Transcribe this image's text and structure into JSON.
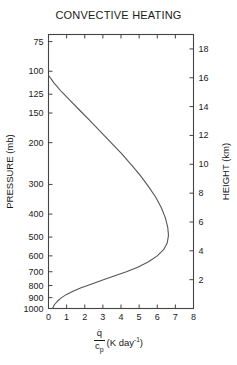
{
  "chart_data": {
    "type": "line",
    "title": "CONVECTIVE HEATING",
    "xlabel": "q̇ / c_p (K day⁻¹)",
    "ylabel": "PRESSURE (mb)",
    "y2label": "HEIGHT (km)",
    "xlim": [
      0,
      8
    ],
    "ylim": [
      70,
      1000
    ],
    "yscale": "log-pressure (inverted)",
    "y2lim": [
      0,
      19
    ],
    "grid": false,
    "legend": null,
    "xticks": [
      0,
      1,
      2,
      3,
      4,
      5,
      6,
      7,
      8
    ],
    "xticklabels": [
      "0",
      "1",
      "2",
      "3",
      "4",
      "5",
      "6",
      "7",
      "8"
    ],
    "yticks": [
      75,
      100,
      125,
      150,
      200,
      300,
      400,
      500,
      600,
      700,
      800,
      900,
      1000
    ],
    "yticklabels": [
      "75",
      "100",
      "125",
      "150",
      "200",
      "300",
      "400",
      "500",
      "600",
      "700",
      "800",
      "900",
      "1000"
    ],
    "y2ticks": [
      2,
      4,
      6,
      8,
      10,
      12,
      14,
      16,
      18
    ],
    "y2ticklabels": [
      "2",
      "4",
      "6",
      "8",
      "10",
      "12",
      "14",
      "16",
      "18"
    ],
    "series": [
      {
        "name": "convective heating rate",
        "x": [
          0.04,
          0.3,
          0.72,
          1.2,
          1.72,
          2.3,
          2.88,
          3.45,
          4.02,
          4.55,
          5.05,
          5.5,
          5.9,
          6.22,
          6.45,
          6.58,
          6.62,
          6.55,
          6.35,
          6.0,
          5.52,
          4.95,
          4.3,
          3.62,
          2.95,
          2.35,
          1.8,
          1.35,
          1.0,
          0.72,
          0.5,
          0.33,
          0.22
        ],
        "y": [
          105,
          112,
          122,
          133,
          146,
          162,
          180,
          200,
          222,
          247,
          274,
          305,
          338,
          375,
          415,
          455,
          492,
          530,
          565,
          600,
          635,
          668,
          700,
          730,
          760,
          790,
          818,
          845,
          872,
          900,
          930,
          962,
          1000
        ]
      }
    ],
    "annotations": []
  },
  "axis_titles": {
    "x_numerator": "q̇",
    "x_denominator_main": "c",
    "x_denominator_sub": "p",
    "x_units_pre": "(K day",
    "x_units_sup": "-1",
    "x_units_post": ")"
  }
}
